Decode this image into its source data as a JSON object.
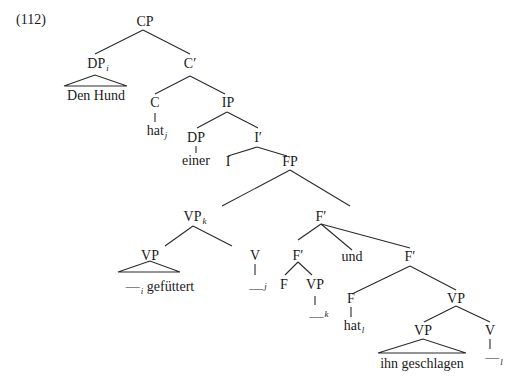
{
  "example_number": "(112)",
  "nodes": {
    "cp": {
      "label": "CP"
    },
    "dp_i": {
      "label": "DP",
      "index": "i"
    },
    "den_hund": {
      "label": "Den Hund"
    },
    "c_bar": {
      "label": "C′"
    },
    "c": {
      "label": "C"
    },
    "hat_j": {
      "label": "hat",
      "index": "j"
    },
    "ip": {
      "label": "IP"
    },
    "dp": {
      "label": "DP"
    },
    "einer": {
      "label": "einer"
    },
    "i_bar": {
      "label": "I′"
    },
    "i": {
      "label": "I"
    },
    "fp": {
      "label": "FP"
    },
    "vp_k": {
      "label": "VP",
      "index": "k"
    },
    "vp_inner": {
      "label": "VP"
    },
    "gefuttert_trace": {
      "label": "—",
      "index": "i"
    },
    "gefuttert": {
      "label": "gefüttert"
    },
    "v": {
      "label": "V"
    },
    "v_trace": {
      "label": "—",
      "index": "j"
    },
    "f_bar_top": {
      "label": "F′"
    },
    "f_bar_left": {
      "label": "F′"
    },
    "f_left": {
      "label": "F"
    },
    "vp_left": {
      "label": "VP"
    },
    "vp_left_trace": {
      "label": "—",
      "index": "k"
    },
    "und": {
      "label": "und"
    },
    "f_bar_right": {
      "label": "F′"
    },
    "f_right": {
      "label": "F"
    },
    "hat_l": {
      "label": "hat",
      "index": "l"
    },
    "vp_right": {
      "label": "VP"
    },
    "vp_right_inner": {
      "label": "VP"
    },
    "ihn_geschlagen": {
      "label": "ihn geschlagen"
    },
    "v_right": {
      "label": "V"
    },
    "v_right_trace": {
      "label": "—",
      "index": "l"
    }
  }
}
